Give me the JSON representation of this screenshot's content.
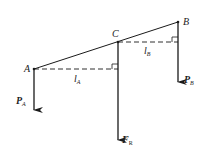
{
  "diagram": {
    "points": {
      "A": {
        "label": "A"
      },
      "B": {
        "label": "B"
      },
      "C": {
        "label": "C"
      }
    },
    "distances": {
      "lA": {
        "main": "l",
        "sub": "A"
      },
      "lB": {
        "main": "l",
        "sub": "B"
      }
    },
    "forces": {
      "PA": {
        "main": "P",
        "sub": "A"
      },
      "PB": {
        "main": "P",
        "sub": "B"
      },
      "FR": {
        "main": "F",
        "sub": "R"
      }
    },
    "colors": {
      "line": "#1a1a1a",
      "background": "#ffffff"
    }
  }
}
